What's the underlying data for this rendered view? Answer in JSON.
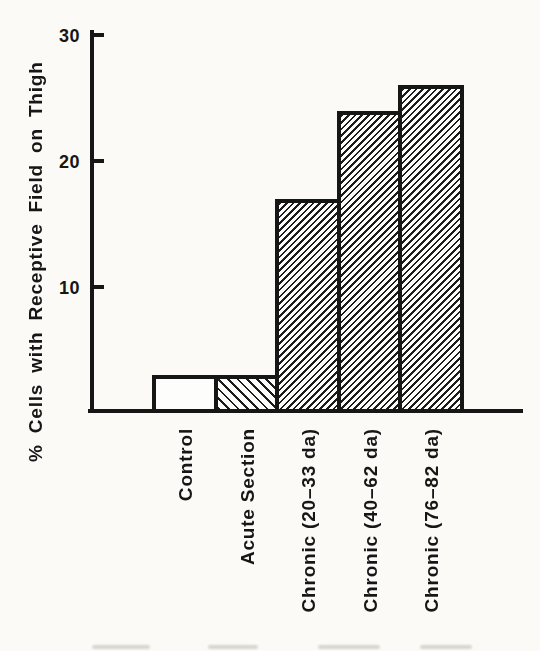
{
  "figure": {
    "background_color": "#fbfaf7",
    "ink_color": "#161616",
    "note": "scanned black-and-white bar graph with hatched bars"
  },
  "chart_data": {
    "type": "bar",
    "title": "",
    "xlabel": "",
    "ylabel": "% Cells with Receptive Field on Thigh",
    "ylim": [
      0,
      30
    ],
    "yticks": [
      10,
      20,
      30
    ],
    "grid": false,
    "legend": null,
    "categories": [
      "Control",
      "Acute Section",
      "Chronic (20–33 da)",
      "Chronic (40–62 da)",
      "Chronic (76–82 da)"
    ],
    "values": [
      3,
      3,
      17,
      24,
      26
    ],
    "bar_fills": [
      "none",
      "hatch-backslash",
      "hatch-slash",
      "hatch-slash",
      "hatch-slash"
    ]
  }
}
